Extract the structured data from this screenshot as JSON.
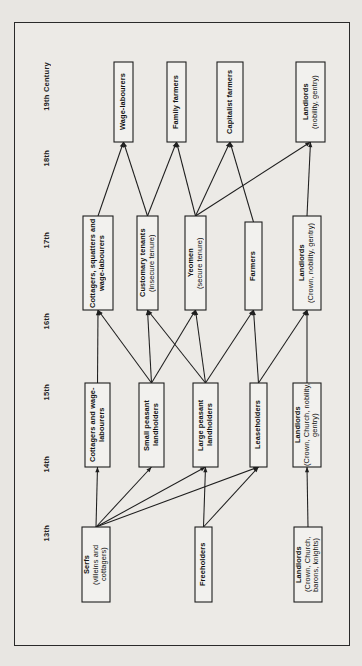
{
  "diagram": {
    "orientation": "rotated-90",
    "frame": {
      "stroke": "#1e1e1e",
      "fill": "#eceae6"
    },
    "century_axis": {
      "name": "century-axis",
      "labels": [
        {
          "id": "c19",
          "text": "19th Century",
          "y": 62
        },
        {
          "id": "c18",
          "text": "18th",
          "y": 150
        },
        {
          "id": "c17",
          "text": "17th",
          "y": 232
        },
        {
          "id": "c16",
          "text": "16th",
          "y": 313
        },
        {
          "id": "c15",
          "text": "15th",
          "y": 384
        },
        {
          "id": "c14",
          "text": "14th",
          "y": 456
        },
        {
          "id": "c13",
          "text": "13th",
          "y": 525
        }
      ]
    },
    "nodes": [
      {
        "id": "wage_labourers",
        "main": "Wage-labourers",
        "sub": "",
        "x": 114,
        "y": 62,
        "w": 19,
        "h": 80,
        "century": "19th Century"
      },
      {
        "id": "family_farmers",
        "main": "Family farmers",
        "sub": "",
        "x": 167,
        "y": 62,
        "w": 19,
        "h": 80,
        "century": "19th Century"
      },
      {
        "id": "capitalist_farmers",
        "main": "Capitalist farmers",
        "sub": "",
        "x": 217,
        "y": 62,
        "w": 26,
        "h": 80,
        "century": "19th Century"
      },
      {
        "id": "landlords_19",
        "main": "Landlords",
        "sub": "(nobility, gentry)",
        "x": 296,
        "y": 62,
        "w": 29,
        "h": 80,
        "century": "19th Century"
      },
      {
        "id": "cottagers_squatters",
        "main": "Cottagers, squatters and wage-labourers",
        "sub": "",
        "x": 83,
        "y": 216,
        "w": 30,
        "h": 94,
        "century": "17th"
      },
      {
        "id": "customary_tenants",
        "main": "Customary tenants",
        "sub": "(insecure tenure)",
        "x": 137,
        "y": 216,
        "w": 21,
        "h": 94,
        "century": "17th"
      },
      {
        "id": "yeomen",
        "main": "Yeomen",
        "sub": "(secure tenure)",
        "x": 185,
        "y": 216,
        "w": 21,
        "h": 94,
        "century": "17th"
      },
      {
        "id": "farmers_17",
        "main": "Farmers",
        "sub": "",
        "x": 245,
        "y": 222,
        "w": 17,
        "h": 88,
        "century": "17th"
      },
      {
        "id": "landlords_17",
        "main": "Landlords",
        "sub": "(Crown, nobility, gentry)",
        "x": 293,
        "y": 216,
        "w": 28,
        "h": 94,
        "century": "17th"
      },
      {
        "id": "cottagers_wage",
        "main": "Cottagers and wage-labourers",
        "sub": "",
        "x": 85,
        "y": 383,
        "w": 25,
        "h": 84,
        "century": "15th"
      },
      {
        "id": "small_peasant",
        "main": "Small peasant landholders",
        "sub": "",
        "x": 139,
        "y": 383,
        "w": 25,
        "h": 84,
        "century": "15th"
      },
      {
        "id": "large_peasant",
        "main": "Large peasant landholders",
        "sub": "",
        "x": 193,
        "y": 383,
        "w": 25,
        "h": 84,
        "century": "15th"
      },
      {
        "id": "leaseholders",
        "main": "Leaseholders",
        "sub": "",
        "x": 250,
        "y": 383,
        "w": 17,
        "h": 84,
        "century": "15th"
      },
      {
        "id": "landlords_15",
        "main": "Landlords",
        "sub": "(Crown, Church, nobility, gentry)",
        "x": 293,
        "y": 383,
        "w": 28,
        "h": 84,
        "century": "15th"
      },
      {
        "id": "serfs",
        "main": "Serfs",
        "sub": "(villeins and cottagers)",
        "x": 82,
        "y": 527,
        "w": 28,
        "h": 75,
        "century": "13th"
      },
      {
        "id": "freeholders",
        "main": "Freeholders",
        "sub": "",
        "x": 195,
        "y": 527,
        "w": 17,
        "h": 75,
        "century": "13th"
      },
      {
        "id": "landlords_13",
        "main": "Landlords",
        "sub": "(Crown, Church, barons, knights)",
        "x": 294,
        "y": 527,
        "w": 28,
        "h": 75,
        "century": "13th"
      }
    ],
    "edges": [
      {
        "from": "serfs",
        "to": "cottagers_wage"
      },
      {
        "from": "serfs",
        "to": "small_peasant"
      },
      {
        "from": "serfs",
        "to": "large_peasant"
      },
      {
        "from": "serfs",
        "to": "leaseholders"
      },
      {
        "from": "freeholders",
        "to": "large_peasant"
      },
      {
        "from": "freeholders",
        "to": "leaseholders"
      },
      {
        "from": "landlords_13",
        "to": "landlords_15"
      },
      {
        "from": "cottagers_wage",
        "to": "cottagers_squatters"
      },
      {
        "from": "small_peasant",
        "to": "cottagers_squatters"
      },
      {
        "from": "small_peasant",
        "to": "customary_tenants"
      },
      {
        "from": "small_peasant",
        "to": "yeomen"
      },
      {
        "from": "large_peasant",
        "to": "customary_tenants"
      },
      {
        "from": "large_peasant",
        "to": "yeomen"
      },
      {
        "from": "large_peasant",
        "to": "farmers_17"
      },
      {
        "from": "leaseholders",
        "to": "farmers_17"
      },
      {
        "from": "leaseholders",
        "to": "landlords_17"
      },
      {
        "from": "landlords_15",
        "to": "landlords_17"
      },
      {
        "from": "cottagers_squatters",
        "to": "wage_labourers"
      },
      {
        "from": "customary_tenants",
        "to": "wage_labourers"
      },
      {
        "from": "customary_tenants",
        "to": "family_farmers"
      },
      {
        "from": "yeomen",
        "to": "family_farmers"
      },
      {
        "from": "yeomen",
        "to": "capitalist_farmers"
      },
      {
        "from": "yeomen",
        "to": "landlords_19"
      },
      {
        "from": "farmers_17",
        "to": "capitalist_farmers"
      },
      {
        "from": "landlords_17",
        "to": "landlords_19"
      }
    ]
  }
}
